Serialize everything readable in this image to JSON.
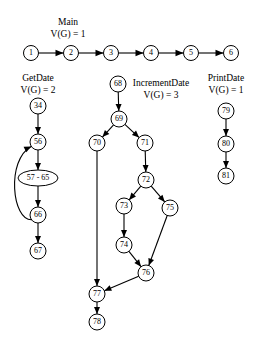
{
  "figure": {
    "background_color": "#ffffff",
    "stroke_color": "#000000",
    "width": 264,
    "height": 362
  },
  "groups": [
    {
      "id": "main",
      "title": "Main",
      "complexity": "V(G) = 1",
      "title_x": 68,
      "title_y": 25,
      "sub_x": 68,
      "sub_y": 37
    },
    {
      "id": "getdate",
      "title": "GetDate",
      "complexity": "V(G) = 2",
      "title_x": 38,
      "title_y": 81,
      "sub_x": 38,
      "sub_y": 93
    },
    {
      "id": "incrementdate",
      "title": "IncrementDate",
      "complexity": "V(G) = 3",
      "title_x": 161,
      "title_y": 86,
      "sub_x": 161,
      "sub_y": 98
    },
    {
      "id": "printdate",
      "title": "PrintDate",
      "complexity": "V(G) = 1",
      "title_x": 226,
      "title_y": 81,
      "sub_x": 226,
      "sub_y": 93
    }
  ],
  "nodes": [
    {
      "id": "n1",
      "label": "1",
      "cx": 31,
      "cy": 53,
      "r": 7.5,
      "shape": "circle",
      "group": "main"
    },
    {
      "id": "n2",
      "label": "2",
      "cx": 71,
      "cy": 53,
      "r": 7.5,
      "shape": "circle",
      "group": "main"
    },
    {
      "id": "n3",
      "label": "3",
      "cx": 111,
      "cy": 53,
      "r": 7.5,
      "shape": "circle",
      "group": "main"
    },
    {
      "id": "n4",
      "label": "4",
      "cx": 151,
      "cy": 53,
      "r": 7.5,
      "shape": "circle",
      "group": "main"
    },
    {
      "id": "n5",
      "label": "5",
      "cx": 191,
      "cy": 53,
      "r": 7.5,
      "shape": "circle",
      "group": "main"
    },
    {
      "id": "n6",
      "label": "6",
      "cx": 231,
      "cy": 53,
      "r": 7.5,
      "shape": "circle",
      "group": "main"
    },
    {
      "id": "n34",
      "label": "34",
      "cx": 38,
      "cy": 106,
      "r": 8,
      "shape": "circle",
      "group": "getdate"
    },
    {
      "id": "n56",
      "label": "56",
      "cx": 38,
      "cy": 142,
      "r": 8,
      "shape": "circle",
      "group": "getdate"
    },
    {
      "id": "n57",
      "label": "57 - 65",
      "cx": 38,
      "cy": 178,
      "rx": 20,
      "ry": 8,
      "shape": "ellipse",
      "group": "getdate"
    },
    {
      "id": "n66",
      "label": "66",
      "cx": 38,
      "cy": 215,
      "r": 8,
      "shape": "circle",
      "group": "getdate"
    },
    {
      "id": "n67",
      "label": "67",
      "cx": 38,
      "cy": 251,
      "r": 8,
      "shape": "circle",
      "group": "getdate"
    },
    {
      "id": "n68",
      "label": "68",
      "cx": 118,
      "cy": 84,
      "r": 8,
      "shape": "circle",
      "group": "incrementdate"
    },
    {
      "id": "n69",
      "label": "69",
      "cx": 119,
      "cy": 119,
      "r": 8,
      "shape": "circle",
      "group": "incrementdate"
    },
    {
      "id": "n70",
      "label": "70",
      "cx": 97,
      "cy": 143,
      "r": 8,
      "shape": "circle",
      "group": "incrementdate"
    },
    {
      "id": "n71",
      "label": "71",
      "cx": 145,
      "cy": 143,
      "r": 8,
      "shape": "circle",
      "group": "incrementdate"
    },
    {
      "id": "n72",
      "label": "72",
      "cx": 146,
      "cy": 180,
      "r": 8,
      "shape": "circle",
      "group": "incrementdate"
    },
    {
      "id": "n73",
      "label": "73",
      "cx": 124,
      "cy": 206,
      "r": 8,
      "shape": "circle",
      "group": "incrementdate"
    },
    {
      "id": "n75",
      "label": "75",
      "cx": 170,
      "cy": 208,
      "r": 8,
      "shape": "circle",
      "group": "incrementdate"
    },
    {
      "id": "n74",
      "label": "74",
      "cx": 124,
      "cy": 245,
      "r": 8,
      "shape": "circle",
      "group": "incrementdate"
    },
    {
      "id": "n76",
      "label": "76",
      "cx": 146,
      "cy": 273,
      "r": 8,
      "shape": "circle",
      "group": "incrementdate"
    },
    {
      "id": "n77",
      "label": "77",
      "cx": 97,
      "cy": 294,
      "r": 8,
      "shape": "circle",
      "group": "incrementdate"
    },
    {
      "id": "n78",
      "label": "78",
      "cx": 97,
      "cy": 322,
      "r": 8,
      "shape": "circle",
      "group": "incrementdate"
    },
    {
      "id": "n79",
      "label": "79",
      "cx": 226,
      "cy": 111,
      "r": 8,
      "shape": "circle",
      "group": "printdate"
    },
    {
      "id": "n80",
      "label": "80",
      "cx": 226,
      "cy": 144,
      "r": 8,
      "shape": "circle",
      "group": "printdate"
    },
    {
      "id": "n81",
      "label": "81",
      "cx": 226,
      "cy": 176,
      "r": 8,
      "shape": "circle",
      "group": "printdate"
    }
  ],
  "edges": [
    {
      "from": "n1",
      "to": "n2",
      "kind": "straight"
    },
    {
      "from": "n2",
      "to": "n3",
      "kind": "straight"
    },
    {
      "from": "n3",
      "to": "n4",
      "kind": "straight"
    },
    {
      "from": "n4",
      "to": "n5",
      "kind": "straight"
    },
    {
      "from": "n5",
      "to": "n6",
      "kind": "straight"
    },
    {
      "from": "n34",
      "to": "n56",
      "kind": "straight"
    },
    {
      "from": "n56",
      "to": "n57",
      "kind": "straight"
    },
    {
      "from": "n57",
      "to": "n66",
      "kind": "straight"
    },
    {
      "from": "n66",
      "to": "n67",
      "kind": "straight"
    },
    {
      "from": "n66",
      "to": "n56",
      "kind": "back-loop-left"
    },
    {
      "from": "n68",
      "to": "n69",
      "kind": "straight"
    },
    {
      "from": "n69",
      "to": "n70",
      "kind": "straight"
    },
    {
      "from": "n69",
      "to": "n71",
      "kind": "straight"
    },
    {
      "from": "n71",
      "to": "n72",
      "kind": "straight"
    },
    {
      "from": "n72",
      "to": "n73",
      "kind": "straight"
    },
    {
      "from": "n72",
      "to": "n75",
      "kind": "straight"
    },
    {
      "from": "n73",
      "to": "n74",
      "kind": "straight"
    },
    {
      "from": "n74",
      "to": "n76",
      "kind": "straight"
    },
    {
      "from": "n75",
      "to": "n76",
      "kind": "straight"
    },
    {
      "from": "n76",
      "to": "n77",
      "kind": "straight"
    },
    {
      "from": "n70",
      "to": "n77",
      "kind": "straight"
    },
    {
      "from": "n77",
      "to": "n78",
      "kind": "straight"
    },
    {
      "from": "n79",
      "to": "n80",
      "kind": "straight"
    },
    {
      "from": "n80",
      "to": "n81",
      "kind": "straight"
    }
  ]
}
